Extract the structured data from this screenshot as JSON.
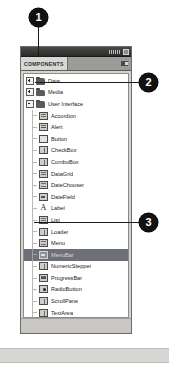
{
  "panel": {
    "chrome": {
      "grip_icon": "window-grip-icon",
      "close_icon": "panel-collapse-icon"
    },
    "tab_label": "COMPONENTS",
    "menu_icon": "panel-menu-icon",
    "tree": [
      {
        "label": "Data",
        "level": 0,
        "expander": "plus",
        "icon": "folder-icon",
        "icon_variant": "folder",
        "selected": false
      },
      {
        "label": "Media",
        "level": 0,
        "expander": "plus",
        "icon": "folder-icon",
        "icon_variant": "folder",
        "selected": false
      },
      {
        "label": "User Interface",
        "level": 0,
        "expander": "minus",
        "icon": "folder-icon",
        "icon_variant": "folder",
        "selected": false
      },
      {
        "label": "Accordion",
        "level": 1,
        "expander": "none",
        "icon": "accordion-icon",
        "icon_variant": "",
        "selected": false
      },
      {
        "label": "Alert",
        "level": 1,
        "expander": "none",
        "icon": "alert-icon",
        "icon_variant": "narrow",
        "selected": false
      },
      {
        "label": "Button",
        "level": 1,
        "expander": "none",
        "icon": "button-icon",
        "icon_variant": "plain",
        "selected": false
      },
      {
        "label": "CheckBox",
        "level": 1,
        "expander": "none",
        "icon": "checkbox-icon",
        "icon_variant": "vsplit",
        "selected": false
      },
      {
        "label": "ComboBox",
        "level": 1,
        "expander": "none",
        "icon": "combobox-icon",
        "icon_variant": "vsplit",
        "selected": false
      },
      {
        "label": "DataGrid",
        "level": 1,
        "expander": "none",
        "icon": "datagrid-icon",
        "icon_variant": "",
        "selected": false
      },
      {
        "label": "DateChooser",
        "level": 1,
        "expander": "none",
        "icon": "datechooser-icon",
        "icon_variant": "",
        "selected": false
      },
      {
        "label": "DateField",
        "level": 1,
        "expander": "none",
        "icon": "datefield-icon",
        "icon_variant": "bar",
        "selected": false
      },
      {
        "label": "Label",
        "level": 1,
        "expander": "none",
        "icon": "label-icon",
        "icon_variant": "label-a",
        "selected": false
      },
      {
        "label": "List",
        "level": 1,
        "expander": "none",
        "icon": "list-icon",
        "icon_variant": "",
        "selected": false
      },
      {
        "label": "Loader",
        "level": 1,
        "expander": "none",
        "icon": "loader-icon",
        "icon_variant": "vsplit",
        "selected": false
      },
      {
        "label": "Menu",
        "level": 1,
        "expander": "none",
        "icon": "menu-icon",
        "icon_variant": "",
        "selected": false
      },
      {
        "label": "MenuBar",
        "level": 1,
        "expander": "none",
        "icon": "menubar-icon",
        "icon_variant": "bar",
        "selected": true
      },
      {
        "label": "NumericStepper",
        "level": 1,
        "expander": "none",
        "icon": "numericstepper-icon",
        "icon_variant": "vsplit",
        "selected": false
      },
      {
        "label": "ProgressBar",
        "level": 1,
        "expander": "none",
        "icon": "progressbar-icon",
        "icon_variant": "narrow",
        "selected": false
      },
      {
        "label": "RadioButton",
        "level": 1,
        "expander": "none",
        "icon": "radiobutton-icon",
        "icon_variant": "dot",
        "selected": false
      },
      {
        "label": "ScrollPane",
        "level": 1,
        "expander": "none",
        "icon": "scrollpane-icon",
        "icon_variant": "vsplit",
        "selected": false
      },
      {
        "label": "TextArea",
        "level": 1,
        "expander": "none",
        "icon": "textarea-icon",
        "icon_variant": "vsplit",
        "selected": false
      },
      {
        "label": "TextInput",
        "level": 1,
        "expander": "none",
        "icon": "textinput-icon",
        "icon_variant": "narrow",
        "selected": false
      },
      {
        "label": "Tree",
        "level": 1,
        "expander": "none",
        "icon": "tree-icon",
        "icon_variant": "",
        "selected": false
      },
      {
        "label": "UIScrollBar",
        "level": 1,
        "expander": "none",
        "icon": "uiscrollbar-icon",
        "icon_variant": "vsplit",
        "selected": false
      },
      {
        "label": "Window",
        "level": 1,
        "expander": "none",
        "icon": "window-icon",
        "icon_variant": "vsplit",
        "selected": false
      }
    ]
  },
  "callouts": [
    {
      "number": "1",
      "target": "panel-title-bar"
    },
    {
      "number": "2",
      "target": "tree-row-user-interface"
    },
    {
      "number": "3",
      "target": "tree-row-menubar"
    }
  ],
  "colors": {
    "callout_fill": "#111111",
    "callout_text": "#ffffff",
    "selection": "#6d7078",
    "panel_bg": "#d6d4d0",
    "tree_bg": "#ffffff"
  }
}
